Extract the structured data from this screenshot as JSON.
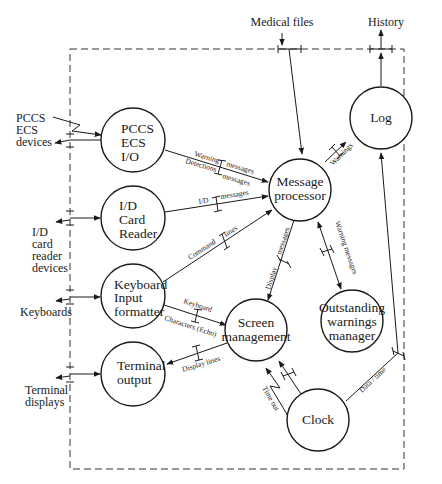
{
  "diagram": {
    "type": "data-flow-diagram",
    "nodes": {
      "pccs": {
        "lines": [
          "PCCS",
          "ECS",
          "I/O"
        ]
      },
      "idcard": {
        "lines": [
          "I/D",
          "Card",
          "Reader"
        ]
      },
      "keyboard": {
        "lines": [
          "Keyboard",
          "Input",
          "formatter"
        ]
      },
      "terminal": {
        "lines": [
          "Terminal",
          "output"
        ]
      },
      "message": {
        "lines": [
          "Message",
          "processor"
        ]
      },
      "log": {
        "lines": [
          "Log"
        ]
      },
      "screen": {
        "lines": [
          "Screen",
          "management"
        ]
      },
      "outstanding": {
        "lines": [
          "Outstanding",
          "warnings",
          "manager"
        ]
      },
      "clock": {
        "lines": [
          "Clock"
        ]
      }
    },
    "externals": {
      "medical_files": "Medical files",
      "history": "History",
      "pccs_devices": [
        "PCCS",
        "ECS",
        "devices"
      ],
      "idcard_devices": [
        "I/D",
        "card",
        "reader",
        "devices"
      ],
      "keyboards": "Keyboards",
      "terminal_displays": [
        "Terminal",
        "displays"
      ]
    },
    "flows": {
      "warning_a": "Warning",
      "warning_b": "messages",
      "detections_a": "Detections",
      "detections_b": "messages",
      "id_a": "I/D",
      "id_b": "messages",
      "command_a": "Command",
      "command_b": "lines",
      "warnings_log": "Warnings",
      "display_a": "Display",
      "display_b": "messages",
      "warning_messages": "Warning messages",
      "keyboard": "Keyboard",
      "characters": "Characters (Echo)",
      "display_lines": "Display lines",
      "time_out": "Time out",
      "data_time": "Data / time"
    }
  }
}
